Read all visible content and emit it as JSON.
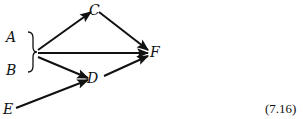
{
  "diagram": {
    "nodes": [
      {
        "id": "A",
        "label": "A",
        "x": 12,
        "y": 41
      },
      {
        "id": "B",
        "label": "B",
        "x": 12,
        "y": 74
      },
      {
        "id": "C",
        "label": "C",
        "x": 94,
        "y": 14
      },
      {
        "id": "D",
        "label": "D",
        "x": 92,
        "y": 82
      },
      {
        "id": "E",
        "label": "E",
        "x": 8,
        "y": 112
      },
      {
        "id": "F",
        "label": "F",
        "x": 151,
        "y": 56
      }
    ],
    "group": {
      "members": [
        "A",
        "B"
      ],
      "symbol": "right-brace"
    },
    "edges": [
      {
        "from": "A,B",
        "to": "C"
      },
      {
        "from": "A,B",
        "to": "F"
      },
      {
        "from": "A,B",
        "to": "D"
      },
      {
        "from": "C",
        "to": "F"
      },
      {
        "from": "D",
        "to": "F"
      },
      {
        "from": "E",
        "to": "D"
      }
    ],
    "equation_number": "(7.16)"
  }
}
